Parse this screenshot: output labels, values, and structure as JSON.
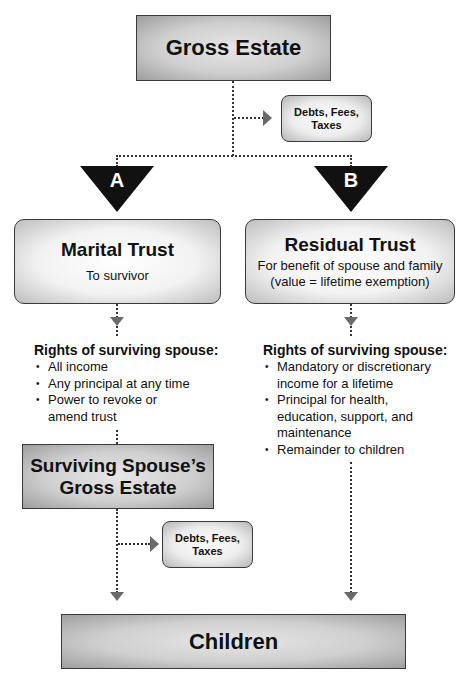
{
  "gross_estate": {
    "label": "Gross Estate"
  },
  "debts_box_1": {
    "line1": "Debts, Fees,",
    "line2": "Taxes"
  },
  "branch_a": {
    "letter": "A"
  },
  "branch_b": {
    "letter": "B"
  },
  "marital_trust": {
    "title": "Marital Trust",
    "subtitle": "To survivor"
  },
  "residual_trust": {
    "title": "Residual Trust",
    "subtitle_line1": "For benefit of spouse and family",
    "subtitle_line2": "(value = lifetime exemption)"
  },
  "rights_a": {
    "heading": "Rights of surviving spouse:",
    "items": [
      {
        "line1": "All income"
      },
      {
        "line1": "Any principal at any time"
      },
      {
        "line1": "Power to revoke or",
        "line2": "amend trust"
      }
    ]
  },
  "rights_b": {
    "heading": "Rights of surviving spouse:",
    "items": [
      {
        "line1": "Mandatory or discretionary",
        "line2": "income for a lifetime"
      },
      {
        "line1": "Principal for health,",
        "line2": "education, support, and",
        "line3": "maintenance"
      },
      {
        "line1": "Remainder to children"
      }
    ]
  },
  "surviving_spouse_estate": {
    "line1": "Surviving Spouse’s",
    "line2": "Gross Estate"
  },
  "debts_box_2": {
    "line1": "Debts, Fees,",
    "line2": "Taxes"
  },
  "children": {
    "label": "Children"
  },
  "colors": {
    "line": "#333333",
    "arrow": "#6a6a6a",
    "triangle": "#111111",
    "box_border": "#3a3a3a"
  }
}
